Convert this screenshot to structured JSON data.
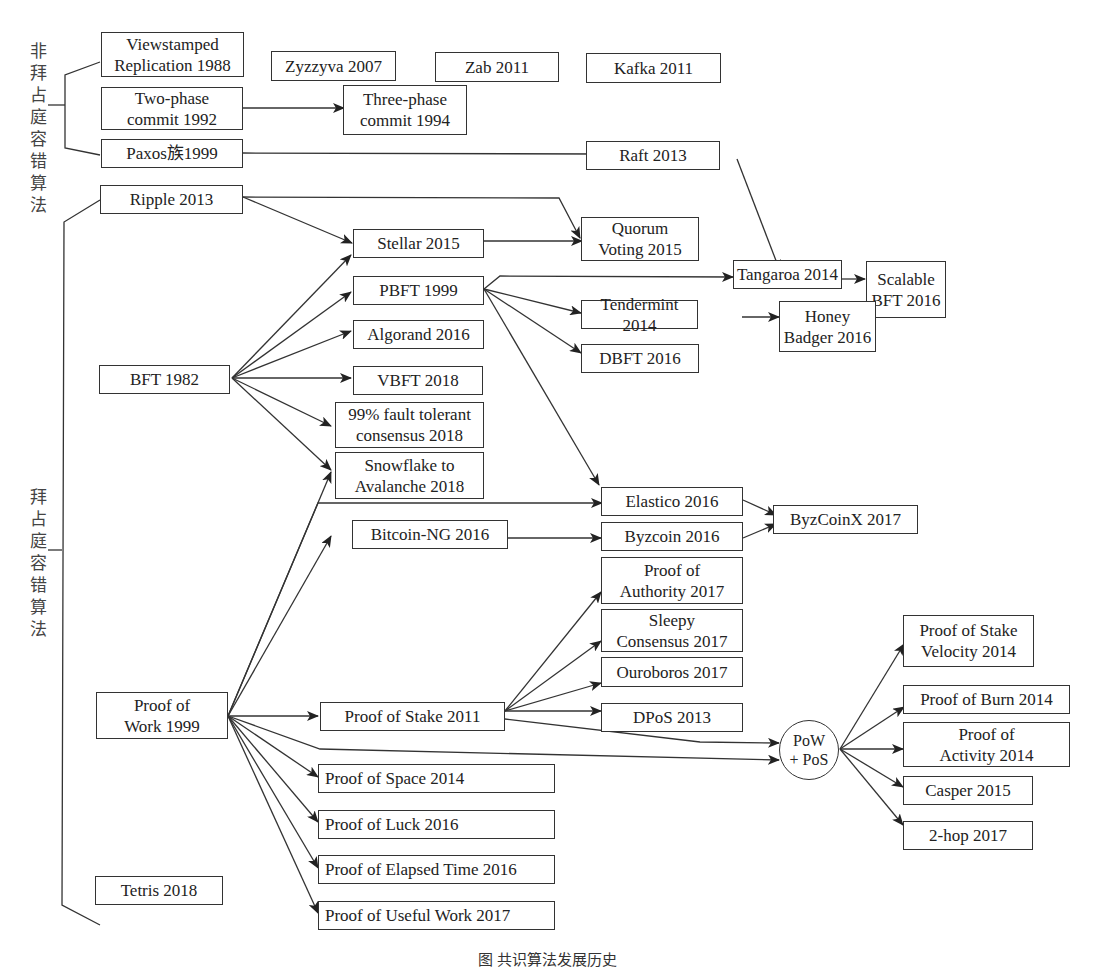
{
  "figure": {
    "caption": "图 共识算法发展历史",
    "groups": {
      "non_byzantine": "非拜占庭容错算法",
      "byzantine": "拜占庭容错算法"
    }
  },
  "nodes": {
    "viewstamped": "Viewstamped\nReplication 1988",
    "zyzzyva": "Zyzzyva 2007",
    "zab": "Zab 2011",
    "kafka": "Kafka 2011",
    "twophase": "Two-phase\ncommit 1992",
    "threephase": "Three-phase\ncommit 1994",
    "paxos": "Paxos族1999",
    "raft": "Raft 2013",
    "ripple": "Ripple 2013",
    "stellar": "Stellar 2015",
    "quorum": "Quorum\nVoting 2015",
    "tangaroa": "Tangaroa 2014",
    "scalable": "Scalable\nBFT 2016",
    "pbft": "PBFT 1999",
    "tendermint": "Tendermint 2014",
    "honey": "Honey\nBadger 2016",
    "algorand": "Algorand 2016",
    "dbft": "DBFT 2016",
    "bft": "BFT 1982",
    "vbft": "VBFT 2018",
    "fault99": "99% fault tolerant\nconsensus 2018",
    "snowflake": "Snowflake to\nAvalanche 2018",
    "elastico": "Elastico 2016",
    "byzcoinx": "ByzCoinX 2017",
    "bitcoinng": "Bitcoin-NG 2016",
    "byzcoin": "Byzcoin 2016",
    "poa": "Proof of\nAuthority 2017",
    "sleepy": "Sleepy\nConsensus 2017",
    "ouroboros": "Ouroboros 2017",
    "pow": "Proof of\nWork 1999",
    "pos": "Proof of Stake 2011",
    "dpos": "DPoS 2013",
    "powpos": "PoW\n+ PoS",
    "posv": "Proof of Stake\nVelocity 2014",
    "pob": "Proof of Burn 2014",
    "poact": "Proof of\nActivity 2014",
    "casper": "Casper 2015",
    "twohop": "2-hop 2017",
    "pospace": "Proof of Space 2014",
    "poluck": "Proof of Luck 2016",
    "poet": "Proof of Elapsed Time 2016",
    "pouw": "Proof of Useful Work 2017",
    "tetris": "Tetris 2018"
  },
  "edges": [
    [
      "twophase",
      "threephase"
    ],
    [
      "paxos",
      "raft"
    ],
    [
      "raft",
      "tangaroa"
    ],
    [
      "ripple",
      "stellar"
    ],
    [
      "ripple",
      "quorum"
    ],
    [
      "stellar",
      "quorum"
    ],
    [
      "pbft",
      "tangaroa"
    ],
    [
      "tangaroa",
      "scalable"
    ],
    [
      "pbft",
      "tendermint"
    ],
    [
      "tendermint",
      "honey"
    ],
    [
      "pbft",
      "dbft"
    ],
    [
      "pbft",
      "elastico"
    ],
    [
      "bft",
      "stellar"
    ],
    [
      "bft",
      "pbft"
    ],
    [
      "bft",
      "algorand"
    ],
    [
      "bft",
      "vbft"
    ],
    [
      "bft",
      "fault99"
    ],
    [
      "bft",
      "snowflake"
    ],
    [
      "pow",
      "snowflake"
    ],
    [
      "pow",
      "elastico"
    ],
    [
      "pow",
      "bitcoinng"
    ],
    [
      "bitcoinng",
      "byzcoin"
    ],
    [
      "elastico",
      "byzcoinx"
    ],
    [
      "byzcoin",
      "byzcoinx"
    ],
    [
      "pow",
      "pos"
    ],
    [
      "pos",
      "poa"
    ],
    [
      "pos",
      "sleepy"
    ],
    [
      "pos",
      "ouroboros"
    ],
    [
      "pos",
      "dpos"
    ],
    [
      "pos",
      "powpos"
    ],
    [
      "pow",
      "powpos"
    ],
    [
      "powpos",
      "posv"
    ],
    [
      "powpos",
      "pob"
    ],
    [
      "powpos",
      "poact"
    ],
    [
      "powpos",
      "casper"
    ],
    [
      "powpos",
      "twohop"
    ],
    [
      "pow",
      "pospace"
    ],
    [
      "pow",
      "poluck"
    ],
    [
      "pow",
      "poet"
    ],
    [
      "pow",
      "pouw"
    ]
  ],
  "colors": {
    "line": "#333333",
    "background": "#ffffff",
    "text": "#222222"
  }
}
